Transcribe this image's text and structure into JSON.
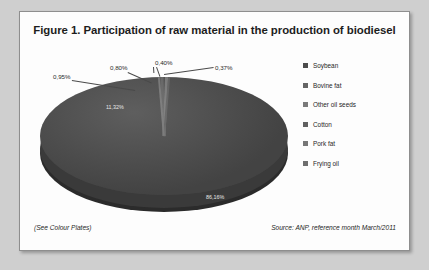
{
  "figure": {
    "title": "Figure 1. Participation of raw material in the production of biodiesel",
    "note_plates": "(See Colour Plates)",
    "source": "Source: ANP, reference month March/2011"
  },
  "chart_data": {
    "type": "pie",
    "title": "Figure 1. Participation of raw material in the production of biodiesel",
    "style": "3d-pie",
    "legend_position": "right",
    "categories": [
      "Soybean",
      "Bovine fat",
      "Other oil seeds",
      "Cotton",
      "Pork fat",
      "Frying oil"
    ],
    "values": [
      86.16,
      11.32,
      0.95,
      0.8,
      0.4,
      0.37
    ],
    "labels": [
      "86,16%",
      "11,32%",
      "0,95%",
      "0,80%",
      "0,40%",
      "0,37%"
    ],
    "label_placement": [
      "inside",
      "inside",
      "outside",
      "outside",
      "outside",
      "outside"
    ],
    "colors": [
      "#4c4c4c",
      "#656565",
      "#7a7a7a",
      "#606060",
      "#777777",
      "#6e6e6e"
    ],
    "xlabel": "",
    "ylabel": "",
    "source": "Source: ANP, reference month March/2011"
  },
  "legend": {
    "items": [
      {
        "label": "Soybean",
        "color": "#4c4c4c"
      },
      {
        "label": "Bovine fat",
        "color": "#656565"
      },
      {
        "label": "Other oil seeds",
        "color": "#7a7a7a"
      },
      {
        "label": "Cotton",
        "color": "#606060"
      },
      {
        "label": "Pork fat",
        "color": "#777777"
      },
      {
        "label": "Frying oil",
        "color": "#6e6e6e"
      }
    ]
  },
  "pie_labels": {
    "soybean": "86,16%",
    "bovine": "11,32%",
    "other_oil_seeds": "0,95%",
    "cotton": "0,80%",
    "pork_fat": "0,40%",
    "frying_oil": "0,37%"
  }
}
